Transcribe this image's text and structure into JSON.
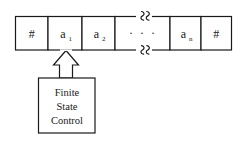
{
  "diagram": {
    "stroke_color": "#1a1a1a",
    "background_color": "#ffffff",
    "tape": {
      "name": "input-tape",
      "cells": [
        {
          "id": "cell-left-marker",
          "base": "#",
          "sub": "",
          "kind": "marker"
        },
        {
          "id": "cell-a1",
          "base": "a",
          "sub": "1",
          "kind": "symbol"
        },
        {
          "id": "cell-a2",
          "base": "a",
          "sub": "2",
          "kind": "symbol"
        },
        {
          "id": "cell-ellipsis",
          "base": "· · ·",
          "sub": "",
          "kind": "ellipsis"
        },
        {
          "id": "cell-an",
          "base": "a",
          "sub": "n",
          "kind": "symbol"
        },
        {
          "id": "cell-right-marker",
          "base": "#",
          "sub": "",
          "kind": "marker"
        }
      ]
    },
    "break_marks": {
      "name": "tape-break-marks",
      "label": "break",
      "count": 2
    },
    "head_pointer": {
      "name": "tape-head-arrow",
      "points_to": "cell-a1",
      "direction": "up"
    },
    "control_box": {
      "name": "finite-state-control",
      "lines": [
        "Finite",
        "State",
        "Control"
      ]
    }
  }
}
